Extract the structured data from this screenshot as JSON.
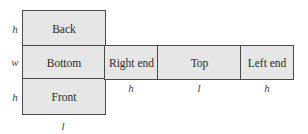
{
  "panels": {
    "back": "Back",
    "bottom": "Bottom",
    "front": "Front",
    "right_end": "Right end",
    "top": "Top",
    "left_end": "Left end"
  },
  "dimensions": {
    "left_back": "h",
    "left_bottom": "w",
    "left_front": "h",
    "below_right_end": "h",
    "below_top": "l",
    "below_left_end": "h",
    "below_front": "l"
  }
}
